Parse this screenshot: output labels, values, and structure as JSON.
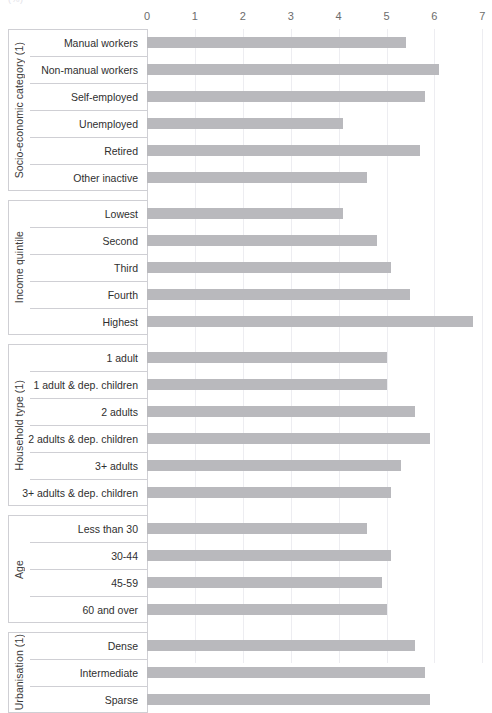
{
  "unit_label": "(%)",
  "axis": {
    "ticks": [
      "0",
      "1",
      "2",
      "3",
      "4",
      "5",
      "6",
      "7"
    ],
    "min": 0,
    "max": 7
  },
  "colors": {
    "bar": "#b9b9bd",
    "gridline": "#ededf1",
    "axis_line": "#d2d2d6",
    "box_border": "#cfcfd4",
    "text": "#2f2f2f",
    "tick_text": "#6c6c6c"
  },
  "chart_data": {
    "type": "bar",
    "orientation": "horizontal",
    "title": "",
    "subtitle": "",
    "xlabel": "(%)",
    "ylabel": "",
    "xlim": [
      0,
      7
    ],
    "grid": true,
    "legend": "none",
    "groups": [
      {
        "name": "Socio-economic category (1)",
        "categories": [
          "Manual workers",
          "Non-manual workers",
          "Self-employed",
          "Unemployed",
          "Retired",
          "Other inactive"
        ],
        "values": [
          5.4,
          6.1,
          5.8,
          4.1,
          5.7,
          4.6
        ]
      },
      {
        "name": "Income quintile",
        "categories": [
          "Lowest",
          "Second",
          "Third",
          "Fourth",
          "Highest"
        ],
        "values": [
          4.1,
          4.8,
          5.1,
          5.5,
          6.8
        ]
      },
      {
        "name": "Household type (1)",
        "categories": [
          "1 adult",
          "1 adult & dep. children",
          "2 adults",
          "2 adults & dep. children",
          "3+ adults",
          "3+ adults & dep. children"
        ],
        "values": [
          5.0,
          5.0,
          5.6,
          5.9,
          5.3,
          5.1
        ]
      },
      {
        "name": "Age",
        "categories": [
          "Less than 30",
          "30-44",
          "45-59",
          "60 and over"
        ],
        "values": [
          4.6,
          5.1,
          4.9,
          5.0
        ]
      },
      {
        "name": "Urbanisation (1)",
        "categories": [
          "Dense",
          "Intermediate",
          "Sparse"
        ],
        "values": [
          5.6,
          5.8,
          5.9
        ]
      }
    ]
  }
}
